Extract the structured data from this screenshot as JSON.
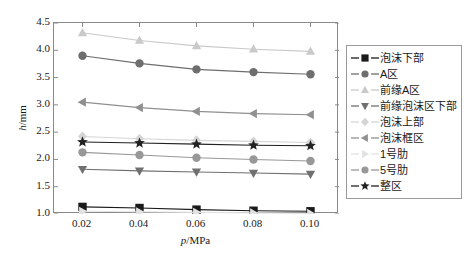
{
  "chart_data": {
    "type": "line",
    "title": "",
    "xlabel": "p/MPa",
    "ylabel": "h/mm",
    "x": [
      0.02,
      0.04,
      0.06,
      0.08,
      0.1
    ],
    "xtick_labels": [
      "0.02",
      "0.04",
      "0.06",
      "0.08",
      "0.10"
    ],
    "ytick_labels": [
      "1.0",
      "1.5",
      "2.0",
      "2.5",
      "3.0",
      "3.5",
      "4.0",
      "4.5"
    ],
    "xlim": [
      0.01,
      0.11
    ],
    "ylim": [
      1.0,
      4.5
    ],
    "grid": false,
    "legend_position": "right-outside",
    "series": [
      {
        "name": "泡沫下部",
        "marker": "square",
        "color": "#1a1a1a",
        "values": [
          1.13,
          1.11,
          1.08,
          1.06,
          1.05
        ]
      },
      {
        "name": "A区",
        "marker": "circle",
        "color": "#6e6e6e",
        "values": [
          3.9,
          3.76,
          3.65,
          3.6,
          3.56
        ]
      },
      {
        "name": "前缘A区",
        "marker": "triangle-up",
        "color": "#c9c9c9",
        "values": [
          4.32,
          4.18,
          4.08,
          4.02,
          3.98
        ]
      },
      {
        "name": "前缘泡沫区下部",
        "marker": "triangle-down",
        "color": "#707070",
        "values": [
          1.82,
          1.79,
          1.77,
          1.75,
          1.73
        ]
      },
      {
        "name": "泡沫上部",
        "marker": "diamond",
        "color": "#d5d5d5",
        "values": [
          2.42,
          2.38,
          2.35,
          2.33,
          2.31
        ]
      },
      {
        "name": "泡沫框区",
        "marker": "triangle-left",
        "color": "#909090",
        "values": [
          3.05,
          2.95,
          2.88,
          2.84,
          2.82
        ]
      },
      {
        "name": "1号肋",
        "marker": "triangle-right",
        "color": "#e2e2e2",
        "values": [
          1.05,
          1.04,
          1.03,
          1.02,
          1.01
        ]
      },
      {
        "name": "5号肋",
        "marker": "circle",
        "color": "#989898",
        "values": [
          2.13,
          2.08,
          2.03,
          2.0,
          1.97
        ]
      },
      {
        "name": "整区",
        "marker": "star",
        "color": "#222222",
        "values": [
          2.32,
          2.3,
          2.28,
          2.26,
          2.25
        ]
      }
    ]
  },
  "legend": {
    "items": [
      {
        "label": "泡沫下部"
      },
      {
        "label": "A区"
      },
      {
        "label": "前缘A区"
      },
      {
        "label": "前缘泡沫区下部"
      },
      {
        "label": "泡沫上部"
      },
      {
        "label": "泡沫框区"
      },
      {
        "label": "1号肋"
      },
      {
        "label": "5号肋"
      },
      {
        "label": "整区"
      }
    ]
  },
  "axes": {
    "y_axis_title_prefix": "h",
    "y_axis_title_suffix": "/mm",
    "x_axis_title_prefix": "p",
    "x_axis_title_suffix": "/MPa"
  }
}
